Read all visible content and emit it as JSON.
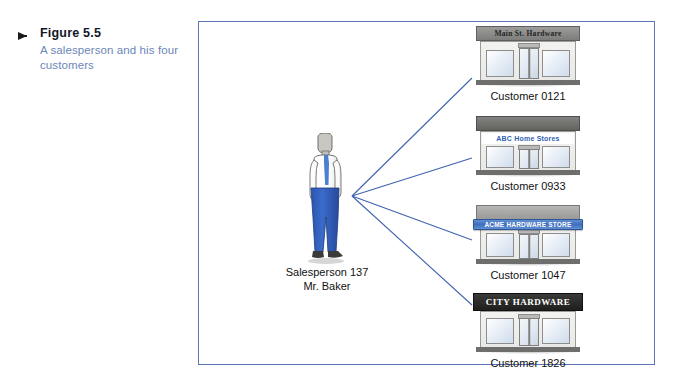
{
  "caption": {
    "marker": "arrow-right",
    "figure_number": "Figure 5.5",
    "description": "A salesperson and his four customers"
  },
  "diagram": {
    "frame_color": "#5b75b5",
    "connector_color": "#3f63b0",
    "salesperson": {
      "name_line1": "Salesperson 137",
      "name_line2": "Mr. Baker",
      "shirt_color": "#ffffff",
      "tie_color": "#3f6fbd",
      "pants_color": "#2f5fc0",
      "skin_color": "#c9c7c2",
      "shoe_color": "#3a3a38"
    },
    "customers": [
      {
        "sign_text": "Main St. Hardware",
        "sign_style": "gray-sign-dark-text",
        "sign_bg": "#8a8a88",
        "sign_fg": "#2b2b2b",
        "label": "Customer 0121"
      },
      {
        "sign_text": "ABC Home Stores",
        "sign_style": "white-sign-blue-text",
        "sign_bg": "#6e6e6c",
        "sign_fg": "#2f5fb0",
        "label": "Customer 0933"
      },
      {
        "sign_text": "ACME HARDWARE STORE",
        "sign_style": "blue-awning-white-text",
        "sign_bg": "#a8a8a6",
        "sign_fg": "#ffffff",
        "label": "Customer 1047"
      },
      {
        "sign_text": "CITY HARDWARE",
        "sign_style": "black-sign-white-text",
        "sign_bg": "#2b2b2b",
        "sign_fg": "#ffffff",
        "label": "Customer 1826"
      }
    ]
  }
}
